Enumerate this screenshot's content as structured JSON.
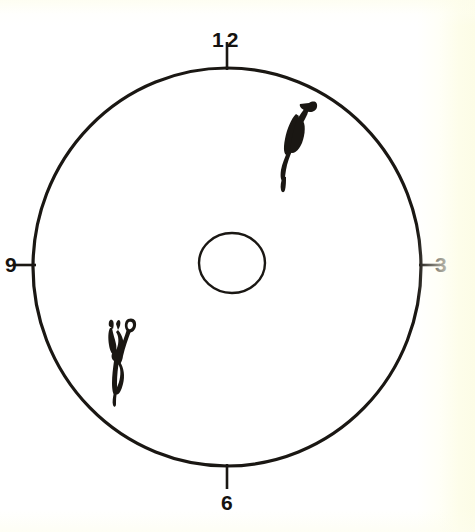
{
  "figure": {
    "kind": "fundus-clock-diagram",
    "background_color": "#ffffff",
    "ink_color": "#1a1713",
    "paper_tint_color": "#fcfce6",
    "outer_circle": {
      "name": "limbus-outline",
      "center_x": 227,
      "center_y": 267,
      "radius_x": 194,
      "radius_y": 199,
      "stroke_width": 3.2
    },
    "inner_circle": {
      "name": "optic-disc-outline",
      "center_x": 232,
      "center_y": 263,
      "radius_x": 33,
      "radius_y": 30,
      "stroke_width": 2.4
    }
  },
  "clock_markers": [
    {
      "id": "12",
      "label": "12",
      "position": "top",
      "angle_deg": 0,
      "tick_length": 26
    },
    {
      "id": "3",
      "label": "3",
      "position": "right",
      "angle_deg": 90,
      "tick_length": 18
    },
    {
      "id": "6",
      "label": "6",
      "position": "bottom",
      "angle_deg": 180,
      "tick_length": 22
    },
    {
      "id": "9",
      "label": "9",
      "position": "left",
      "angle_deg": 270,
      "tick_length": 18
    }
  ],
  "lesions": [
    {
      "id": "lesion-upper-right",
      "name": "upper-right-lesion",
      "description": "elongated hooked tadpole-shaped dark mark",
      "clock_hour": 1,
      "center_x": 297,
      "center_y": 130,
      "color": "#1a1713"
    },
    {
      "id": "lesion-lower-left",
      "name": "lower-left-lesion",
      "description": "branching twisted vessel-like dark mark",
      "clock_hour": 7,
      "center_x": 117,
      "center_y": 358,
      "color": "#1a1713"
    }
  ]
}
